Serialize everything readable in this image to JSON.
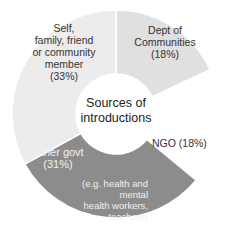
{
  "chart_data": {
    "type": "pie",
    "variant": "donut",
    "title": "Sources of introductions",
    "categories": [
      "Dept of Communities",
      "NGO",
      "Other govt",
      "Self, family, friend or community member"
    ],
    "values": [
      18,
      18,
      31,
      33
    ],
    "colors": [
      "#e0e0e0",
      "#ffffff",
      "#8c8c8c",
      "#ececec"
    ],
    "annotations": [
      "(e.g. health and mental health workers, teachers)"
    ]
  },
  "labels": {
    "center_line1": "Sources of",
    "center_line2": "introductions",
    "dept_line1": "Dept of",
    "dept_line2": "Communities",
    "dept_pct": "(18%)",
    "ngo": "NGO (18%)",
    "other_line1": "Other govt",
    "other_pct": "(31%)",
    "other_note1": "(e.g. health and mental",
    "other_note2": "health workers,",
    "other_note3": "teachers)",
    "self_line1": "Self,",
    "self_line2": "family, friend",
    "self_line3": "or community",
    "self_line4": "member",
    "self_pct": "(33%)"
  }
}
